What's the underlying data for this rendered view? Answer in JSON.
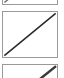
{
  "palette": {
    "name": "diagonal-line-style-palette",
    "orientation": "vertical",
    "background_color": "#ffffff",
    "border_color": "#9a9a9a",
    "cell_count_visible": 3,
    "cells": [
      {
        "index": 0,
        "name": "thin-diagonal-swatch",
        "label": "",
        "visibility": "clipped-top",
        "glyph": "diagonal-line-icon",
        "direction": "bottom-left-to-top-right",
        "stroke_color": "#6f6f6f",
        "stroke_weight": "thin",
        "selected": "false"
      },
      {
        "index": 1,
        "name": "medium-diagonal-swatch",
        "label": "",
        "visibility": "full",
        "glyph": "diagonal-line-icon",
        "direction": "bottom-left-to-top-right",
        "stroke_color": "#2b2b2b",
        "stroke_weight": "medium",
        "selected": "false"
      },
      {
        "index": 2,
        "name": "thick-diagonal-swatch",
        "label": "",
        "visibility": "clipped-bottom",
        "glyph": "diagonal-line-icon",
        "direction": "bottom-left-to-top-right",
        "stroke_color": "#3a3a3a",
        "stroke_weight": "thick",
        "selected": "false"
      }
    ]
  }
}
